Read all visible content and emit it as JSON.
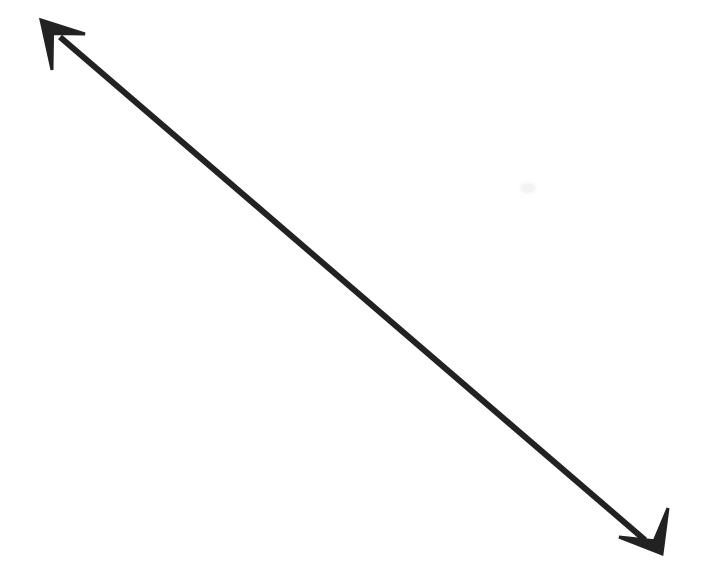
{
  "canvas": {
    "width": 706,
    "height": 586,
    "background_color": "#ffffff",
    "description": "Hand-drawn style double-headed straight arrow spanning diagonally from upper-left to lower-right on a blank white background"
  },
  "arrow": {
    "name": "double-headed-diagonal-arrow",
    "stroke_color": "#222222",
    "stroke_width": 6,
    "direction": "bidirectional",
    "orientation": "upper-left to lower-right diagonal",
    "start_point": {
      "x": 41,
      "y": 20
    },
    "end_point": {
      "x": 662,
      "y": 554
    },
    "shaft": {
      "x1": 60,
      "y1": 37,
      "x2": 645,
      "y2": 540
    },
    "heads": [
      {
        "id": "upper-left-arrowhead",
        "tip": {
          "x": 41,
          "y": 20
        },
        "barb_a": {
          "x": 85,
          "y": 34
        },
        "barb_b": {
          "x": 52,
          "y": 70
        },
        "points_toward": "up-left"
      },
      {
        "id": "lower-right-arrowhead",
        "tip": {
          "x": 662,
          "y": 554
        },
        "barb_a": {
          "x": 668,
          "y": 508
        },
        "barb_b": {
          "x": 619,
          "y": 537
        },
        "points_toward": "down-right"
      }
    ]
  },
  "marks": [
    {
      "id": "faint-smudge",
      "x": 528,
      "y": 188,
      "width": 16,
      "height": 11,
      "color": "#f2f2f2",
      "note": "very faint light gray scan artifact"
    }
  ]
}
